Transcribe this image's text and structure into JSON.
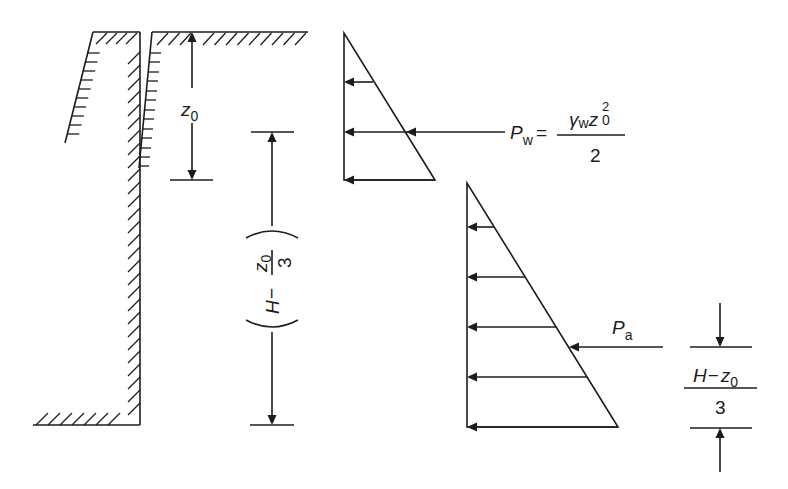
{
  "figure": {
    "title": "",
    "colors": {
      "ink": "#1c1c1c",
      "background": "#ffffff"
    },
    "labels": {
      "z0": {
        "main": "z",
        "sub": "0"
      },
      "dim_mid": {
        "open": "(",
        "H": "H",
        "minus": "−",
        "num_main": "z",
        "num_sub": "0",
        "den": "3",
        "close": ")"
      },
      "pw": {
        "P": "P",
        "sub": "w",
        "eq": "=",
        "gamma": "γ",
        "gamma_sub": "w",
        "z": "z",
        "z_sup": "2",
        "z_sub": "0",
        "den": "2"
      },
      "pa": {
        "P": "P",
        "sub": "a"
      },
      "dim_right": {
        "H": "H",
        "minus": "−",
        "z": "z",
        "z_sub": "0",
        "den": "3"
      }
    },
    "elements": {
      "ground_profile": "cut with tension crack and retaining wall",
      "water_pressure_diagram": "triangle, arrows pointing left",
      "earth_pressure_diagram": "triangle, arrows pointing left"
    }
  }
}
